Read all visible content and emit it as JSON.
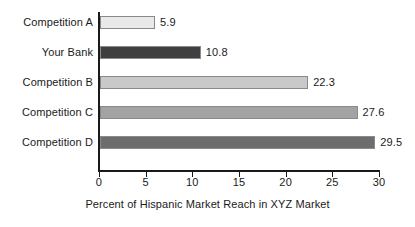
{
  "chart_data": {
    "type": "bar",
    "orientation": "horizontal",
    "title": "",
    "xlabel": "Percent of Hispanic Market Reach in XYZ Market",
    "ylabel": "",
    "categories": [
      "Competition A",
      "Your Bank",
      "Competition B",
      "Competition C",
      "Competition D"
    ],
    "values": [
      5.9,
      10.8,
      22.3,
      27.6,
      29.5
    ],
    "value_labels": [
      "5.9",
      "10.8",
      "22.3",
      "27.6",
      "29.5"
    ],
    "xlim": [
      0,
      30
    ],
    "xticks": [
      0,
      5,
      10,
      15,
      20,
      25,
      30
    ],
    "xtick_labels": [
      "0",
      "5",
      "10",
      "15",
      "20",
      "25",
      "30"
    ],
    "grid": false,
    "legend": false,
    "bar_colors": [
      "#e9e9e9",
      "#3f3f3f",
      "#c9c9c9",
      "#a3a3a3",
      "#6d6d6d"
    ],
    "bar_border_color": "#8a8a8a",
    "axis_color": "#1a1a1a",
    "background": "#ffffff"
  },
  "axis": {
    "x_title": "Percent of Hispanic Market Reach in XYZ Market"
  }
}
